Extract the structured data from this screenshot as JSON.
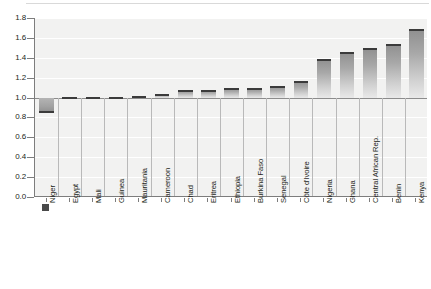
{
  "chart_data": {
    "type": "bar",
    "title": "",
    "subtitle": "",
    "xlabel": "",
    "ylabel": "",
    "ylim": [
      0.0,
      1.8
    ],
    "baseline": 1.0,
    "grid": true,
    "legend": "none",
    "y_ticks": [
      "0.0",
      "0.2",
      "0.4",
      "0.6",
      "0.8",
      "1.0",
      "1.2",
      "1.4",
      "1.6",
      "1.8"
    ],
    "y_tick_values": [
      0.0,
      0.2,
      0.4,
      0.6,
      0.8,
      1.0,
      1.2,
      1.4,
      1.6,
      1.8
    ],
    "categories": [
      "Niger",
      "Egypt",
      "Mali",
      "Guinea",
      "Mauritania",
      "Cameroon",
      "Chad",
      "Eritrea",
      "Ethiopia",
      "Burkina Faso",
      "Senegal",
      "Côte d'Ivoire",
      "Nigeria",
      "Ghana",
      "Central African Rep.",
      "Benin",
      "Kenya"
    ],
    "values": [
      0.84,
      1.01,
      1.01,
      1.01,
      1.02,
      1.04,
      1.08,
      1.08,
      1.1,
      1.1,
      1.12,
      1.17,
      1.39,
      1.46,
      1.5,
      1.54,
      1.69
    ],
    "series": [
      {
        "name": "",
        "values": [
          0.84,
          1.01,
          1.01,
          1.01,
          1.02,
          1.04,
          1.08,
          1.08,
          1.1,
          1.1,
          1.12,
          1.17,
          1.39,
          1.46,
          1.5,
          1.54,
          1.69
        ]
      }
    ],
    "colors": {
      "plot_background": "#f2f2f1",
      "gridline": "#ffffff",
      "baseline": "#8c8c8c",
      "axis": "#7d7d7d",
      "bar_fill_top": "#8f8f8f",
      "bar_fill_bottom": "#e9e9e9",
      "bar_cap": "#3b3b3b",
      "text": "#231f20"
    }
  }
}
